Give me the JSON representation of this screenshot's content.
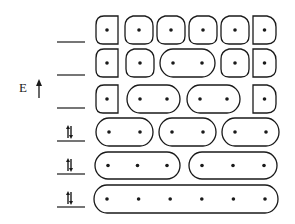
{
  "axis": {
    "label": "E",
    "arrow": "up-arrow-icon"
  },
  "colors": {
    "stroke": "#1a1a1a",
    "background": "#ffffff"
  },
  "levels": [
    {
      "index": 1,
      "occupancy": "empty",
      "y": 42
    },
    {
      "index": 2,
      "occupancy": "empty",
      "y": 75
    },
    {
      "index": 3,
      "occupancy": "empty",
      "y": 108
    },
    {
      "index": 4,
      "occupancy": "spin-pair",
      "y": 141
    },
    {
      "index": 5,
      "occupancy": "spin-pair",
      "y": 174
    },
    {
      "index": 6,
      "occupancy": "spin-pair",
      "y": 207
    }
  ],
  "rows": [
    {
      "y": 16,
      "h": 28,
      "groups": [
        {
          "x": 96,
          "w": 22,
          "dots": 1,
          "shape": "d-left"
        },
        {
          "x": 125,
          "w": 28,
          "dots": 1,
          "shape": "round"
        },
        {
          "x": 157,
          "w": 28,
          "dots": 1,
          "shape": "round"
        },
        {
          "x": 189,
          "w": 28,
          "dots": 1,
          "shape": "round"
        },
        {
          "x": 221,
          "w": 28,
          "dots": 1,
          "shape": "round"
        },
        {
          "x": 253,
          "w": 23,
          "dots": 1,
          "shape": "d-right"
        }
      ]
    },
    {
      "y": 49,
      "h": 28,
      "groups": [
        {
          "x": 96,
          "w": 22,
          "dots": 1,
          "shape": "d-left"
        },
        {
          "x": 126,
          "w": 28,
          "dots": 1,
          "shape": "round"
        },
        {
          "x": 160,
          "w": 55,
          "dots": 2,
          "shape": "pill"
        },
        {
          "x": 221,
          "w": 28,
          "dots": 1,
          "shape": "round"
        },
        {
          "x": 253,
          "w": 23,
          "dots": 1,
          "shape": "d-right"
        }
      ]
    },
    {
      "y": 85,
      "h": 28,
      "groups": [
        {
          "x": 96,
          "w": 22,
          "dots": 1,
          "shape": "d-left"
        },
        {
          "x": 127,
          "w": 53,
          "dots": 2,
          "shape": "pill"
        },
        {
          "x": 187,
          "w": 53,
          "dots": 2,
          "shape": "pill"
        },
        {
          "x": 253,
          "w": 23,
          "dots": 1,
          "shape": "d-right"
        }
      ]
    },
    {
      "y": 118,
      "h": 28,
      "groups": [
        {
          "x": 96,
          "w": 57,
          "dots": 2,
          "shape": "pill"
        },
        {
          "x": 159,
          "w": 57,
          "dots": 2,
          "shape": "pill"
        },
        {
          "x": 222,
          "w": 57,
          "dots": 2,
          "shape": "pill"
        }
      ]
    },
    {
      "y": 152,
      "h": 27,
      "groups": [
        {
          "x": 95,
          "w": 85,
          "dots": 3,
          "shape": "pill"
        },
        {
          "x": 189,
          "w": 88,
          "dots": 3,
          "shape": "pill"
        }
      ]
    },
    {
      "y": 185,
      "h": 28,
      "groups": [
        {
          "x": 94,
          "w": 184,
          "dots": 6,
          "shape": "pill"
        }
      ]
    }
  ]
}
